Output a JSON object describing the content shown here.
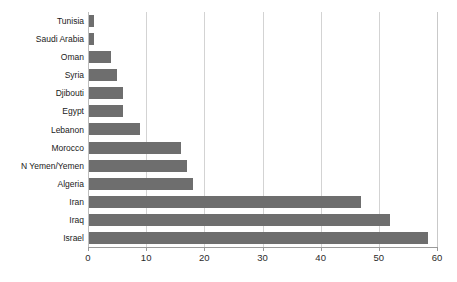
{
  "chart_data": {
    "type": "bar",
    "orientation": "horizontal",
    "title": "",
    "subtitle": "",
    "xlabel": "",
    "ylabel": "",
    "categories": [
      "Tunisia",
      "Saudi Arabia",
      "Oman",
      "Syria",
      "Djibouti",
      "Egypt",
      "Lebanon",
      "Morocco",
      "N Yemen/Yemen",
      "Algeria",
      "Iran",
      "Iraq",
      "Israel"
    ],
    "values": [
      1,
      1,
      4,
      5,
      6,
      6,
      9,
      16,
      17,
      18,
      47,
      52,
      58.5
    ],
    "xlim": [
      0,
      60
    ],
    "xticks": [
      0,
      10,
      20,
      30,
      40,
      50,
      60
    ],
    "xtick_labels": [
      "0",
      "10",
      "20",
      "30",
      "40",
      "50",
      "60"
    ],
    "gridlines": "vertical",
    "grid": true,
    "legend": null,
    "legend_position": "none",
    "series": [
      {
        "name": "",
        "values": [
          1,
          1,
          4,
          5,
          6,
          6,
          9,
          16,
          17,
          18,
          47,
          52,
          58.5
        ]
      }
    ],
    "colors": {
      "bar": "#6e6e6e",
      "gridline": "#d3d3d3",
      "axis": "#9a9a9a",
      "text": "#1a1a1a",
      "background": "#ffffff"
    }
  }
}
